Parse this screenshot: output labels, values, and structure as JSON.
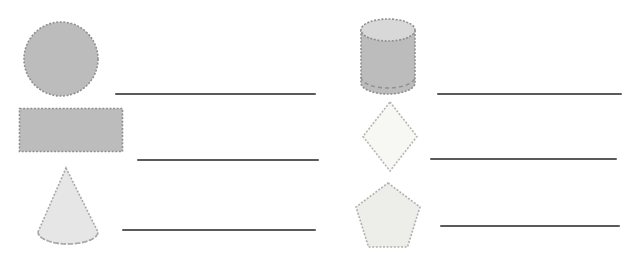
{
  "worksheet": {
    "title": "Shape Naming Worksheet",
    "background_color": "#ffffff",
    "width": 638,
    "height": 253,
    "line_color": "#5a5a5a",
    "stroke_color": "#9a9a9a"
  },
  "columns": [
    {
      "name": "left-column",
      "items": [
        {
          "id": "circle",
          "icon": "circle-shape-icon",
          "shape": "circle",
          "label": "Circle",
          "fill": "#bcbcbc",
          "stroke": "#8f8f8f",
          "answer": "",
          "answer_placeholder": ""
        },
        {
          "id": "rectangle",
          "icon": "rectangle-shape-icon",
          "shape": "rectangle",
          "label": "Rectangle",
          "fill": "#bcbcbc",
          "stroke": "#8f8f8f",
          "answer": "",
          "answer_placeholder": ""
        },
        {
          "id": "cone",
          "icon": "cone-shape-icon",
          "shape": "cone",
          "label": "Cone",
          "fill": "#e6e6e6",
          "stroke": "#a8a8a8",
          "answer": "",
          "answer_placeholder": ""
        }
      ]
    },
    {
      "name": "right-column",
      "items": [
        {
          "id": "cylinder",
          "icon": "cylinder-shape-icon",
          "shape": "cylinder",
          "label": "Cylinder",
          "fill": "#bcbcbc",
          "top_fill": "#d8d8d8",
          "stroke": "#8f8f8f",
          "answer": "",
          "answer_placeholder": ""
        },
        {
          "id": "diamond",
          "icon": "diamond-shape-icon",
          "shape": "rhombus",
          "label": "Diamond",
          "fill": "#f7f7f4",
          "stroke": "#b5b5b0",
          "answer": "",
          "answer_placeholder": ""
        },
        {
          "id": "pentagon",
          "icon": "pentagon-shape-icon",
          "shape": "pentagon",
          "label": "Pentagon",
          "fill": "#ededea",
          "stroke": "#b0b0ab",
          "answer": "",
          "answer_placeholder": ""
        }
      ]
    }
  ]
}
